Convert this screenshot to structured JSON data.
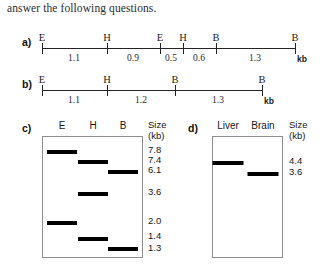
{
  "intro": {
    "text": "answer the following questions."
  },
  "maps": [
    {
      "id": "a",
      "label": "a)",
      "unit": "kb",
      "sites": [
        {
          "name": "E",
          "x": 42
        },
        {
          "name": "H",
          "x": 107
        },
        {
          "name": "E",
          "x": 160
        },
        {
          "name": "H",
          "x": 183
        },
        {
          "name": "B",
          "x": 216
        },
        {
          "name": "B",
          "x": 295
        }
      ],
      "segments": [
        {
          "value": "1.1",
          "x": 74
        },
        {
          "value": "0.9",
          "x": 133
        },
        {
          "value": "0.5",
          "x": 171
        },
        {
          "value": "0.6",
          "x": 199
        },
        {
          "value": "1.3",
          "x": 255
        }
      ]
    },
    {
      "id": "b",
      "label": "b)",
      "unit": "kb",
      "sites": [
        {
          "name": "E",
          "x": 42
        },
        {
          "name": "H",
          "x": 107
        },
        {
          "name": "B",
          "x": 175
        },
        {
          "name": "B",
          "x": 262
        }
      ],
      "segments": [
        {
          "value": "1.1",
          "x": 74
        },
        {
          "value": "1.2",
          "x": 141
        },
        {
          "value": "1.3",
          "x": 218
        }
      ]
    }
  ],
  "gels": [
    {
      "id": "c",
      "label": "c)",
      "size_header_line1": "Size",
      "size_header_line2": "(kb)",
      "lanes": [
        {
          "name": "E",
          "x": 62
        },
        {
          "name": "H",
          "x": 93
        },
        {
          "name": "B",
          "x": 123
        }
      ],
      "bands": [
        {
          "lane": "E",
          "size": "7.8",
          "x": 62,
          "y": 150,
          "width": 30
        },
        {
          "lane": "H",
          "size": "7.4",
          "x": 93,
          "y": 160,
          "width": 30
        },
        {
          "lane": "B",
          "size": "6.1",
          "x": 123,
          "y": 170,
          "width": 30
        },
        {
          "lane": "H",
          "size": "3.6",
          "x": 93,
          "y": 192,
          "width": 30
        },
        {
          "lane": "E",
          "size": "2.0",
          "x": 62,
          "y": 221,
          "width": 30
        },
        {
          "lane": "H",
          "size": "1.4",
          "x": 93,
          "y": 237,
          "width": 30
        },
        {
          "lane": "B",
          "size": "1.3",
          "x": 123,
          "y": 247,
          "width": 30
        }
      ],
      "size_markers": [
        {
          "value": "7.8",
          "y": 146
        },
        {
          "value": "7.4",
          "y": 156
        },
        {
          "value": "6.1",
          "y": 166
        },
        {
          "value": "3.6",
          "y": 188
        },
        {
          "value": "2.0",
          "y": 217
        },
        {
          "value": "1.4",
          "y": 232
        },
        {
          "value": "1.3",
          "y": 244
        }
      ]
    },
    {
      "id": "d",
      "label": "d)",
      "size_header_line1": "Size",
      "size_header_line2": "(kb)",
      "lanes": [
        {
          "name": "Liver",
          "x": 228
        },
        {
          "name": "Brain",
          "x": 263
        }
      ],
      "bands": [
        {
          "lane": "Liver",
          "size": "4.4",
          "x": 228,
          "y": 161,
          "width": 31
        },
        {
          "lane": "Brain",
          "size": "3.6",
          "x": 263,
          "y": 172,
          "width": 31
        }
      ],
      "size_markers": [
        {
          "value": "4.4",
          "y": 157
        },
        {
          "value": "3.6",
          "y": 168
        }
      ]
    }
  ],
  "colors": {
    "band": "#000000",
    "gel_border": "#8d8d8d",
    "axis": "#232323",
    "text": "#1a1a1a"
  }
}
